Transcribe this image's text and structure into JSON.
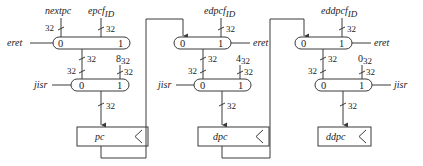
{
  "diagram": {
    "type": "register-transfer datapath",
    "columns": [
      {
        "top_mux": {
          "inputs": [
            "nextpc",
            "epcf_ID"
          ],
          "input_widths": [
            "32",
            "32"
          ],
          "port0": "0",
          "port1": "1",
          "select": "eret",
          "output_width": "32"
        },
        "bottom_mux": {
          "inputs": [
            "from top mux",
            "8_32"
          ],
          "input_widths": [
            "32",
            "32"
          ],
          "port0": "0",
          "port1": "1",
          "select": "jisr",
          "output_width": "32"
        },
        "register": "pc"
      },
      {
        "top_mux": {
          "inputs": [
            "pc",
            "edpcf_ID"
          ],
          "input_widths": [
            "",
            "32"
          ],
          "port0": "0",
          "port1": "1",
          "select": "eret",
          "output_width": "32"
        },
        "bottom_mux": {
          "inputs": [
            "from top mux",
            "4_32"
          ],
          "input_widths": [
            "32",
            "32"
          ],
          "port0": "0",
          "port1": "1",
          "select": "jisr",
          "output_width": "32"
        },
        "register": "dpc"
      },
      {
        "top_mux": {
          "inputs": [
            "dpc",
            "eddpcf_ID"
          ],
          "input_widths": [
            "",
            "32"
          ],
          "port0": "0",
          "port1": "1",
          "select": "eret",
          "output_width": "32"
        },
        "bottom_mux": {
          "inputs": [
            "from top mux",
            "0_32"
          ],
          "input_widths": [
            "32",
            "32"
          ],
          "port0": "0",
          "port1": "1",
          "select": "jisr",
          "output_width": "32"
        },
        "register": "ddpc"
      }
    ]
  },
  "labels": {
    "nextpc": "nextpc",
    "epc": "epcf",
    "edpc": "edpcf",
    "eddpc": "eddpcf",
    "id_sub": "ID",
    "eret": "eret",
    "jisr": "jisr",
    "w32": "32",
    "c8": "8",
    "c4": "4",
    "c0": "0",
    "sub32": "32",
    "port0": "0",
    "port1": "1",
    "pc": "pc",
    "dpc": "dpc",
    "ddpc": "ddpc"
  }
}
